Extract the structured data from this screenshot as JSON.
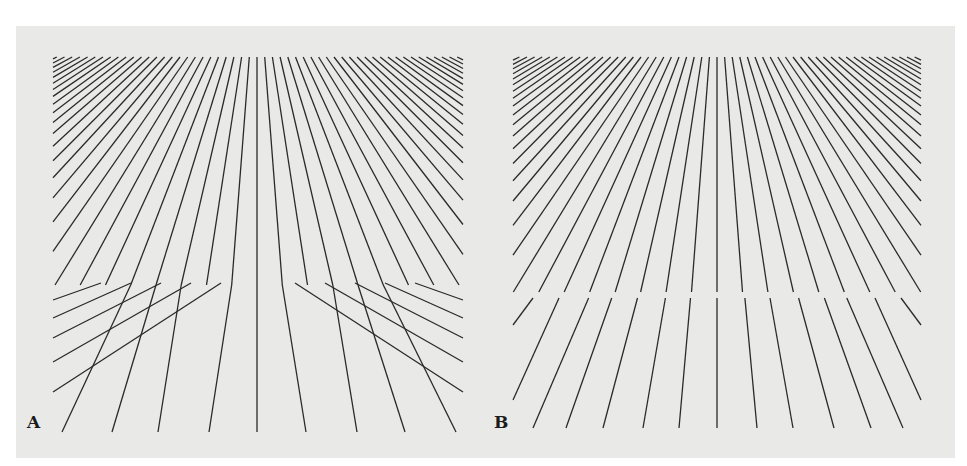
{
  "figure": {
    "background_color": "#e9e9e7",
    "page_color": "#ffffff",
    "line_color": "#2a2a2a",
    "line_width": 1.3,
    "panels": [
      {
        "label": "A",
        "label_pos": [
          27,
          432
        ],
        "type": "bent",
        "rect": {
          "left": 53,
          "right": 463,
          "top": 57,
          "bottom": 432
        },
        "split_y": 285,
        "center_x": 257,
        "upper_fan": {
          "vanish_y": -43,
          "top_spacing": 7.7,
          "half_count": 27
        },
        "lower_fan": {
          "bottom_positions": [
            62,
            112,
            158,
            209,
            257,
            306,
            357,
            405,
            456
          ]
        }
      },
      {
        "label": "B",
        "label_pos": [
          494,
          432
        ],
        "type": "broken",
        "rect": {
          "left": 513,
          "right": 921,
          "top": 57,
          "bottom": 428
        },
        "split_y": 292,
        "gap": 6,
        "center_x": 717,
        "upper_fan": {
          "vanish_y": -43,
          "top_spacing": 7.6,
          "half_count": 27
        },
        "lower_fan": {
          "bottom_positions": [
            533,
            566,
            603,
            643,
            679,
            717,
            757,
            793,
            834,
            871,
            903
          ]
        }
      }
    ]
  }
}
